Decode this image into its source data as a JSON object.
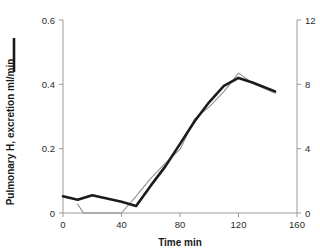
{
  "chart_data": {
    "type": "line",
    "title": "",
    "xlabel": "Time min",
    "ylabel": "Pulmonary H, excretion ml/min",
    "ylabel_right": "",
    "xlim": [
      0,
      160
    ],
    "ylim": [
      0,
      0.6
    ],
    "ylim_right": [
      0,
      12
    ],
    "xticks": [
      0,
      40,
      80,
      120,
      160
    ],
    "xtick_labels": [
      "0",
      "40",
      "80",
      "120",
      "160"
    ],
    "yticks": [
      0,
      0.2,
      0.4,
      0.6
    ],
    "ytick_labels": [
      "0",
      "0.2",
      "0.4",
      "0.6"
    ],
    "yticks_right": [
      0,
      4,
      8,
      12
    ],
    "ytick_labels_right": [
      "0",
      "4",
      "8",
      "12"
    ],
    "grid": false,
    "legend_position": "y-axis-label",
    "series": [
      {
        "name": "Pulmonary H, excretion ml/min",
        "axis": "left",
        "style": "thick-solid",
        "color": "#1b1b1b",
        "x": [
          0,
          10,
          20,
          30,
          40,
          50,
          60,
          70,
          80,
          90,
          100,
          110,
          120,
          130,
          145
        ],
        "values": [
          0.052,
          0.041,
          0.055,
          0.045,
          0.035,
          0.022,
          0.085,
          0.145,
          0.215,
          0.285,
          0.345,
          0.395,
          0.42,
          0.405,
          0.378
        ]
      },
      {
        "name": "Breath hydrogen ppm",
        "axis": "right",
        "style": "thin-solid",
        "color": "#909090",
        "x": [
          10,
          14,
          40,
          50,
          60,
          70,
          80,
          90,
          100,
          110,
          120,
          130,
          145
        ],
        "values": [
          0.55,
          0.0,
          0.0,
          1.05,
          2.15,
          3.1,
          3.95,
          5.85,
          6.6,
          7.55,
          8.7,
          8.05,
          7.45
        ]
      }
    ]
  },
  "legend": {
    "primary_marker": "line-segment"
  }
}
